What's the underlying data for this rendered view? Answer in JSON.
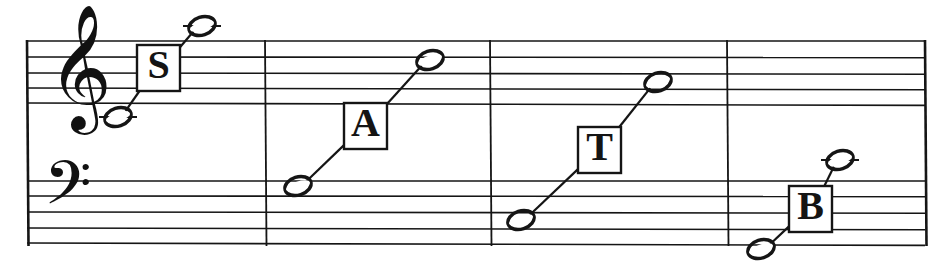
{
  "figure": {
    "kind": "music-notation",
    "system": "grand-staff",
    "measure_count": 4,
    "ink_color": "#151515",
    "paper_color": "#ffffff"
  },
  "staff": {
    "treble": {
      "clef_name": "treble-clef",
      "clef_glyph": "𝄞",
      "line_ys": [
        41,
        57,
        73,
        88,
        103
      ]
    },
    "bass": {
      "clef_name": "bass-clef",
      "clef_glyph": "𝄢",
      "line_ys": [
        181,
        196,
        212,
        228,
        243
      ]
    },
    "barline_xs": [
      27,
      265,
      490,
      727,
      925
    ],
    "left_edge_x": 27,
    "right_edge_x": 925
  },
  "measures": [
    {
      "id": "measure-soprano",
      "label": "S",
      "voice": "Soprano",
      "box": {
        "x": 137,
        "y": 45,
        "w": 43,
        "h": 46
      },
      "low_note": {
        "cx": 118,
        "cy": 117,
        "ledger": true,
        "ledger_w": 38
      },
      "high_note": {
        "cx": 202,
        "cy": 26,
        "ledger": true,
        "ledger_w": 38
      }
    },
    {
      "id": "measure-alto",
      "label": "A",
      "voice": "Alto",
      "box": {
        "x": 344,
        "y": 103,
        "w": 43,
        "h": 46
      },
      "low_note": {
        "cx": 298,
        "cy": 186,
        "ledger": false,
        "ledger_w": 0
      },
      "high_note": {
        "cx": 430,
        "cy": 60,
        "ledger": false,
        "ledger_w": 0
      }
    },
    {
      "id": "measure-tenor",
      "label": "T",
      "voice": "Tenor",
      "box": {
        "x": 578,
        "y": 127,
        "w": 43,
        "h": 46
      },
      "low_note": {
        "cx": 521,
        "cy": 220,
        "ledger": false,
        "ledger_w": 0
      },
      "high_note": {
        "cx": 658,
        "cy": 82,
        "ledger": false,
        "ledger_w": 0
      }
    },
    {
      "id": "measure-bass",
      "label": "B",
      "voice": "Bass",
      "box": {
        "x": 789,
        "y": 186,
        "w": 43,
        "h": 46
      },
      "low_note": {
        "cx": 761,
        "cy": 249,
        "ledger": false,
        "ledger_w": 0
      },
      "high_note": {
        "cx": 840,
        "cy": 160,
        "ledger": true,
        "ledger_w": 38
      }
    }
  ],
  "chart_data": {
    "type": "table",
    "categories": [
      "S",
      "A",
      "T",
      "B"
    ],
    "series": [
      {
        "name": "lowest-note-y",
        "values": [
          117,
          186,
          220,
          249
        ]
      },
      {
        "name": "highest-note-y",
        "values": [
          26,
          60,
          82,
          160
        ]
      }
    ]
  }
}
